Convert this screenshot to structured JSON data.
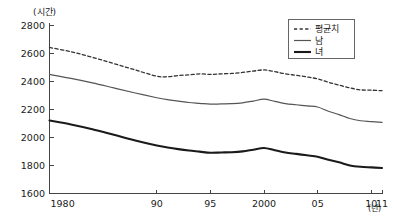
{
  "chart_data": {
    "type": "line",
    "title": "",
    "subtitle": "",
    "ylabel": "(시간)",
    "xlabel": "(년)",
    "y_unit": "(시간)",
    "x_unit": "(년)",
    "grid": false,
    "legend_position": "top-right",
    "ylim": [
      1600,
      2800
    ],
    "xlim": [
      1980,
      2011
    ],
    "yticks": [
      1600,
      1800,
      2000,
      2200,
      2400,
      2600,
      2800
    ],
    "ytick_labels": [
      "1600",
      "1800",
      "2000",
      "2200",
      "2400",
      "2600",
      "2800"
    ],
    "xticks": [
      1980,
      1990,
      1995,
      2000,
      2005,
      2010,
      2011
    ],
    "xtick_labels": [
      "1980",
      "90",
      "95",
      "2000",
      "05",
      "10",
      "11"
    ],
    "x": [
      1980,
      1982,
      1984,
      1986,
      1988,
      1990,
      1991,
      1992,
      1993,
      1994,
      1995,
      1996,
      1997,
      1998,
      1999,
      2000,
      2001,
      2002,
      2003,
      2004,
      2005,
      2006,
      2007,
      2008,
      2009,
      2010,
      2011
    ],
    "series": [
      {
        "name": "평균치",
        "style": "dashed",
        "color": "#333333",
        "values": [
          2640,
          2610,
          2570,
          2525,
          2480,
          2435,
          2432,
          2440,
          2445,
          2452,
          2448,
          2452,
          2455,
          2462,
          2472,
          2480,
          2468,
          2452,
          2442,
          2430,
          2416,
          2392,
          2372,
          2352,
          2338,
          2336,
          2332
        ]
      },
      {
        "name": "남",
        "style": "solid-thin",
        "color": "#555555",
        "values": [
          2448,
          2420,
          2388,
          2352,
          2316,
          2282,
          2268,
          2258,
          2248,
          2242,
          2236,
          2238,
          2240,
          2246,
          2258,
          2272,
          2256,
          2240,
          2232,
          2224,
          2216,
          2186,
          2162,
          2134,
          2118,
          2112,
          2106
        ]
      },
      {
        "name": "녀",
        "style": "solid-thick",
        "color": "#1a1a1a",
        "values": [
          2120,
          2092,
          2058,
          2018,
          1978,
          1942,
          1928,
          1916,
          1906,
          1898,
          1890,
          1892,
          1894,
          1900,
          1912,
          1924,
          1908,
          1892,
          1882,
          1872,
          1862,
          1840,
          1822,
          1800,
          1790,
          1786,
          1782
        ]
      }
    ]
  },
  "legend": {
    "items": [
      {
        "label": "평균치",
        "style": "dashed"
      },
      {
        "label": "남",
        "style": "solid-thin"
      },
      {
        "label": "녀",
        "style": "solid-thick"
      }
    ]
  }
}
